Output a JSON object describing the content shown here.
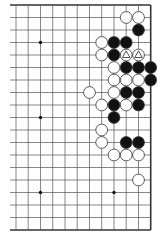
{
  "board": {
    "title": "Go board diagram (partial, right side)",
    "columns_visible": 12,
    "rows_visible": 19,
    "col_x": [
      16,
      28.2,
      40.5,
      52.7,
      65,
      77.2,
      89.5,
      101.7,
      114,
      126.2,
      138.5,
      150.7
    ],
    "row_y": [
      5,
      17.5,
      30,
      42.5,
      55,
      67.5,
      80,
      92.5,
      105,
      117.5,
      130,
      142.5,
      155,
      167.5,
      180,
      192.5,
      205,
      217.5,
      230
    ],
    "left_cut_x": 10,
    "edges": {
      "top": true,
      "bottom": true,
      "right": true,
      "left": false
    },
    "colors": {
      "line": "#555555",
      "edge": "#333333",
      "black_stone": "#111111",
      "white_stone": "#ffffff",
      "stone_outline": "#333333"
    },
    "star_points": [
      [
        2,
        3
      ],
      [
        2,
        9
      ],
      [
        2,
        15
      ],
      [
        8,
        15
      ]
    ],
    "stones": [
      {
        "c": 9,
        "r": 1,
        "color": "white"
      },
      {
        "c": 10,
        "r": 1,
        "color": "white"
      },
      {
        "c": 10,
        "r": 2,
        "color": "black"
      },
      {
        "c": 7,
        "r": 3,
        "color": "white"
      },
      {
        "c": 8,
        "r": 3,
        "color": "black"
      },
      {
        "c": 9,
        "r": 3,
        "color": "black"
      },
      {
        "c": 7,
        "r": 4,
        "color": "white"
      },
      {
        "c": 8,
        "r": 4,
        "color": "black"
      },
      {
        "c": 9,
        "r": 4,
        "color": "white",
        "mark": "triangle"
      },
      {
        "c": 10,
        "r": 4,
        "color": "white",
        "mark": "triangle"
      },
      {
        "c": 8,
        "r": 5,
        "color": "white"
      },
      {
        "c": 9,
        "r": 5,
        "color": "black"
      },
      {
        "c": 10,
        "r": 5,
        "color": "black"
      },
      {
        "c": 11,
        "r": 5,
        "color": "black"
      },
      {
        "c": 8,
        "r": 6,
        "color": "white"
      },
      {
        "c": 9,
        "r": 6,
        "color": "white"
      },
      {
        "c": 10,
        "r": 6,
        "color": "white"
      },
      {
        "c": 11,
        "r": 6,
        "color": "black"
      },
      {
        "c": 6,
        "r": 7,
        "color": "white"
      },
      {
        "c": 8,
        "r": 7,
        "color": "white"
      },
      {
        "c": 9,
        "r": 7,
        "color": "black"
      },
      {
        "c": 10,
        "r": 7,
        "color": "black"
      },
      {
        "c": 7,
        "r": 8,
        "color": "white"
      },
      {
        "c": 8,
        "r": 8,
        "color": "black"
      },
      {
        "c": 9,
        "r": 8,
        "color": "white"
      },
      {
        "c": 10,
        "r": 8,
        "color": "black"
      },
      {
        "c": 8,
        "r": 9,
        "color": "black"
      },
      {
        "c": 7,
        "r": 10,
        "color": "white"
      },
      {
        "c": 7,
        "r": 11,
        "color": "white"
      },
      {
        "c": 9,
        "r": 11,
        "color": "black"
      },
      {
        "c": 10,
        "r": 11,
        "color": "black"
      },
      {
        "c": 8,
        "r": 12,
        "color": "white"
      },
      {
        "c": 9,
        "r": 12,
        "color": "white"
      },
      {
        "c": 10,
        "r": 12,
        "color": "white"
      },
      {
        "c": 10,
        "r": 14,
        "color": "white"
      }
    ]
  }
}
